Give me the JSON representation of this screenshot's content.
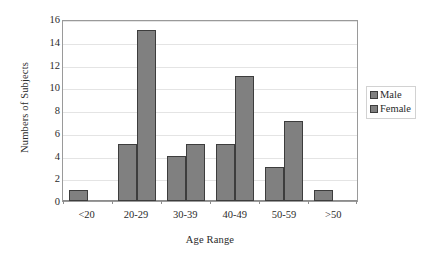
{
  "chart_data": {
    "type": "bar",
    "title": "",
    "subtitle": "",
    "xlabel": "Age Range",
    "ylabel": "Numbers of Subjects",
    "categories": [
      "<20",
      "20-29",
      "30-39",
      "40-49",
      "50-59",
      ">50"
    ],
    "series": [
      {
        "name": "Male",
        "values": [
          1,
          5,
          4,
          5,
          3,
          1
        ],
        "color": "#808080"
      },
      {
        "name": "Female",
        "values": [
          0,
          15,
          5,
          11,
          7,
          0
        ],
        "color": "#808080"
      }
    ],
    "ylim": [
      0,
      16
    ],
    "ytick_labels": [
      "0",
      "2",
      "4",
      "6",
      "8",
      "10",
      "12",
      "14",
      "16"
    ],
    "ytick_values": [
      0,
      2,
      4,
      6,
      8,
      10,
      12,
      14,
      16
    ],
    "grid": "horizontal",
    "legend_position": "right",
    "legend_entries": [
      "Male",
      "Female"
    ],
    "bar_border_color": "#3d3d3d",
    "plot_border_color": "#9a9a9a",
    "gridline_color": "#e4e4e4",
    "background_color": "#ffffff"
  }
}
